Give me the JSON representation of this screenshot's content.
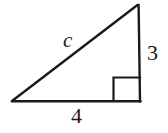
{
  "figure": {
    "type": "right-triangle-diagram",
    "background_color": "#ffffff",
    "stroke_color": "#1a1a1a",
    "stroke_width": 2,
    "geometry": {
      "left_vertex": {
        "x": 12,
        "y": 101
      },
      "bottom_right_vertex": {
        "x": 140,
        "y": 101
      },
      "apex_vertex": {
        "x": 137,
        "y": 5
      },
      "right_angle_marker": {
        "x": 113,
        "y": 77,
        "width": 27,
        "height": 24
      }
    },
    "labels": {
      "hypotenuse": "c",
      "vertical_leg": "3",
      "horizontal_leg": "4"
    }
  }
}
